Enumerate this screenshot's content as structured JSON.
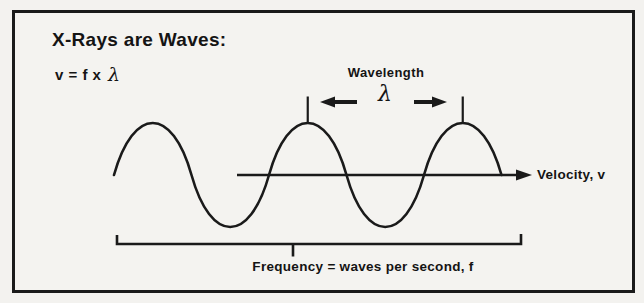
{
  "title": "X-Rays are Waves:",
  "formula": {
    "prefix": "v = f x",
    "lambda": "λ"
  },
  "labels": {
    "wavelength": "Wavelength",
    "lambda": "λ",
    "velocity": "Velocity, v",
    "frequency": "Frequency = waves per second, f"
  },
  "colors": {
    "ink": "#1a1a1a",
    "paper": "#f3f2ef"
  }
}
